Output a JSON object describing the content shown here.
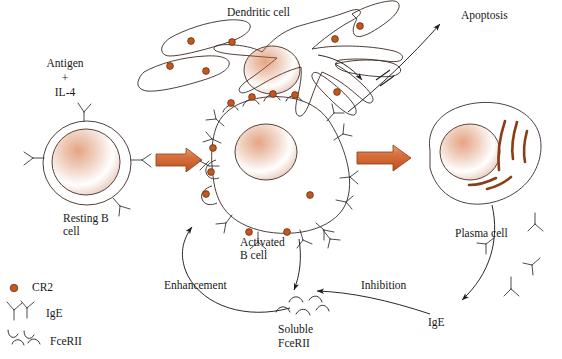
{
  "figure": {
    "title_text_elements": {
      "dendritic_cell": "Dendritic cell",
      "apoptosis": "Apoptosis",
      "antigen": "Antigen",
      "plus": "+",
      "il4": "IL-4",
      "resting_b_cell_line1": "Resting B",
      "resting_b_cell_line2": "cell",
      "activated_b_cell_line1": "Activated",
      "activated_b_cell_line2": "B cell",
      "plasma_cell": "Plasma cell",
      "enhancement": "Enhancement",
      "inhibition": "Inhibition",
      "ige_free": "IgE",
      "soluble_line1": "Soluble",
      "soluble_line2": "FceRII"
    },
    "legend": {
      "items": [
        {
          "symbol": "cr2-dot",
          "label": "CR2"
        },
        {
          "symbol": "ige-y",
          "label": "IgE"
        },
        {
          "symbol": "fceriI-hook",
          "label": "FceRII"
        }
      ]
    },
    "colors": {
      "cytoplasm": "#F6CDB2",
      "cytoplasm_shade": "#F0BE9E",
      "nucleus": "#C4571F",
      "nucleus_dark": "#A8461A",
      "dendrite_arm": "#E08A5A",
      "arrow_block": "#D2683A",
      "arrow_block_light": "#E8A075",
      "er_stripe": "#8C3C16",
      "outline": "#3B2A22",
      "cr2_dot": "#C4571F",
      "text": "#171717",
      "background": "#FFFFFF"
    }
  }
}
